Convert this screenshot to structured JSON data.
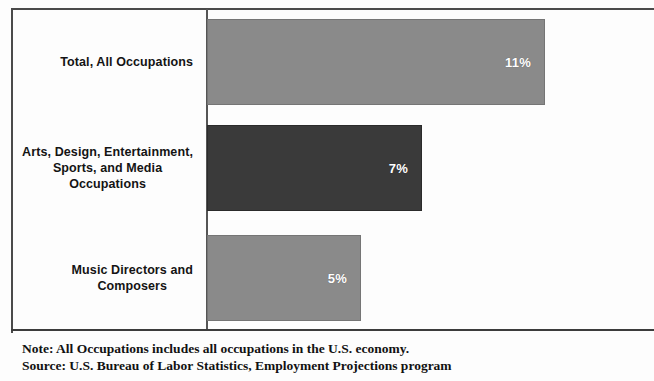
{
  "chart_data": {
    "type": "bar",
    "orientation": "horizontal",
    "title": "",
    "xlabel": "",
    "ylabel": "",
    "categories": [
      "Total, All Occupations",
      "Arts, Design, Entertainment,\nSports, and Media\nOccupations",
      "Music Directors and\nComposers"
    ],
    "values": [
      11,
      7,
      5
    ],
    "value_labels": [
      "11%",
      "7%",
      "5%"
    ],
    "bar_colors": [
      "#8a8a8a",
      "#3a3a3a",
      "#8a8a8a"
    ],
    "xlim": [
      0,
      11
    ],
    "grid": false,
    "legend": null,
    "axis_ticks": [],
    "bars": [
      {
        "category": "Total, All Occupations",
        "value": 11,
        "label": "11%",
        "color": "#8a8a8a",
        "width_px": 338
      },
      {
        "category": "Arts, Design, Entertainment,\nSports, and Media\nOccupations",
        "value": 7,
        "label": "7%",
        "color": "#3a3a3a",
        "width_px": 215
      },
      {
        "category": "Music Directors and\nComposers",
        "value": 5,
        "label": "5%",
        "color": "#8a8a8a",
        "width_px": 154
      }
    ]
  },
  "notes": {
    "note_line": "Note: All Occupations includes all occupations in the U.S. economy.",
    "source_line": "Source: U.S. Bureau of Labor Statistics, Employment Projections program"
  }
}
